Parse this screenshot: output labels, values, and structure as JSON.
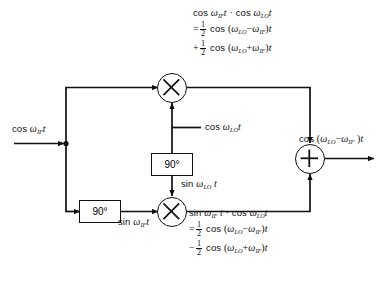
{
  "diagram": {
    "type": "signal-flow-block-diagram",
    "stroke_color": "#111111",
    "background_color": "#ffffff",
    "input": {
      "label_prefix": "cos",
      "omega": "ω",
      "sub": "IF",
      "var": "t",
      "full_text": "cos ωIF t"
    },
    "lo_input": {
      "label_prefix": "cos",
      "omega": "ω",
      "sub": "LO",
      "var": "t",
      "full_text": "cos ωLO t"
    },
    "phase_shifter_top": {
      "label": "90°"
    },
    "phase_shifter_bottom": {
      "label": "90°"
    },
    "lo_quadrature": {
      "label_prefix": "sin",
      "omega": "ω",
      "sub": "LO",
      "var": "t",
      "full_text": "sin ωLO t"
    },
    "if_quadrature": {
      "label_prefix": "sin",
      "omega": "ω",
      "sub": "IF",
      "var": "t",
      "full_text": "sin ωIF t"
    },
    "mixer_top": {
      "symbol": "×",
      "name": "multiplier"
    },
    "mixer_bottom": {
      "symbol": "×",
      "name": "multiplier"
    },
    "summer": {
      "symbol": "+",
      "name": "adder"
    },
    "output": {
      "prefix": "cos",
      "open": "(",
      "omega1": "ω",
      "sub1": "LO",
      "minus": "−",
      "omega2": "ω",
      "sub2": "IF",
      "close": ")",
      "var": "t",
      "full_text": "cos (ωLO − ωIF )t"
    },
    "equation_top": {
      "line1": {
        "fn1": "cos",
        "omega1": "ω",
        "sub1": "IF",
        "var1": "t",
        "dot": "·",
        "fn2": "cos",
        "omega2": "ω",
        "sub2": "LO",
        "var2": "t",
        "full_text": "cos ωIF t · cos ωLO t"
      },
      "line2": {
        "rel": "=",
        "num": "1",
        "den": "2",
        "fn": "cos",
        "open": "(",
        "omega1": "ω",
        "sub1": "LO",
        "op": "−",
        "omega2": "ω",
        "sub2": "IF",
        "close": ")",
        "var": "t",
        "full_text": "= 1/2 cos (ωLO − ωIF)t"
      },
      "line3": {
        "rel": "+",
        "num": "1",
        "den": "2",
        "fn": "cos",
        "open": "(",
        "omega1": "ω",
        "sub1": "LO",
        "op": "+",
        "omega2": "ω",
        "sub2": "IF",
        "close": ")",
        "var": "t",
        "full_text": "+ 1/2 cos (ωLO + ωIF)t"
      }
    },
    "equation_bottom": {
      "line1": {
        "fn1": "sin",
        "omega1": "ω",
        "sub1": "IF",
        "var1": "t",
        "dot": "·",
        "fn2": "cos",
        "omega2": "ω",
        "sub2": "LO",
        "var2": "t",
        "full_text": "sin ωIF t · cos ωLO t"
      },
      "line2": {
        "rel": "=",
        "num": "1",
        "den": "2",
        "fn": "cos",
        "open": "(",
        "omega1": "ω",
        "sub1": "LO",
        "op": "−",
        "omega2": "ω",
        "sub2": "IF",
        "close": ")",
        "var": "t",
        "full_text": "= 1/2 cos (ωLO − ωIF)t"
      },
      "line3": {
        "rel": "−",
        "num": "1",
        "den": "2",
        "fn": "cos",
        "open": "(",
        "omega1": "ω",
        "sub1": "LO",
        "op": "+",
        "omega2": "ω",
        "sub2": "IF",
        "close": ")",
        "var": "t",
        "full_text": "− 1/2 cos (ωLO + ωIF)t"
      }
    }
  }
}
